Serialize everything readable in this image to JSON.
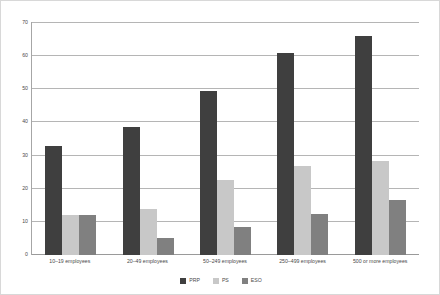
{
  "chart_data": {
    "type": "bar",
    "title": "",
    "subtitle": "",
    "xlabel": "",
    "ylabel": "",
    "ylim": [
      0,
      70
    ],
    "ytick_step": 10,
    "yticks": [
      "0",
      "10",
      "20",
      "30",
      "40",
      "50",
      "60",
      "70"
    ],
    "grid": true,
    "legend_position": "bottom-center",
    "categories": [
      "10–19 employees",
      "20–49 employees",
      "50–249 employees",
      "250–499 employees",
      "500 or more employees"
    ],
    "series": [
      {
        "name": "PRP",
        "color": "#3f3f3f",
        "values": [
          33,
          38.5,
          49.5,
          61,
          66
        ]
      },
      {
        "name": "PS",
        "color": "#c8c8c8",
        "values": [
          12,
          14,
          22.5,
          27,
          28.5
        ]
      },
      {
        "name": "ESO",
        "color": "#808080",
        "values": [
          12,
          5,
          8.5,
          12.5,
          16.5
        ]
      }
    ]
  },
  "style": {
    "background": "#ffffff",
    "frame_color": "#d8d8d8",
    "axis_color": "#a6a6a6",
    "gridline_color": "#b5b5b5",
    "text_color": "#4a4a4a"
  }
}
